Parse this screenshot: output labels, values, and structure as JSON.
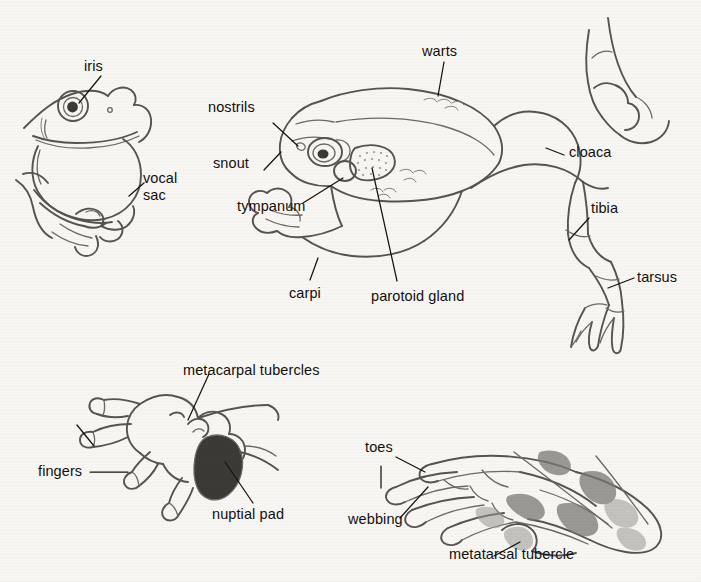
{
  "figure": {
    "background_color": "#f7f6f3",
    "ink_color": "#4a4a4a",
    "label_color": "#14100c",
    "width": 701,
    "height": 582
  },
  "panels": [
    {
      "id": "calling-male-head",
      "name": "Frog head with inflated vocal sac"
    },
    {
      "id": "dorsolateral-body",
      "name": "Whole frog, dorsolateral view"
    },
    {
      "id": "hand",
      "name": "Frog hand (forefoot) with nuptial pad"
    },
    {
      "id": "foot",
      "name": "Frog hind foot with webbing"
    }
  ],
  "labels": [
    {
      "id": "iris",
      "text": "iris",
      "panel": "calling-male-head"
    },
    {
      "id": "vocal-sac",
      "text": "vocal\nsac",
      "panel": "calling-male-head"
    },
    {
      "id": "nostrils",
      "text": "nostrils",
      "panel": "dorsolateral-body"
    },
    {
      "id": "snout",
      "text": "snout",
      "panel": "dorsolateral-body"
    },
    {
      "id": "tympanum",
      "text": "tympanum",
      "panel": "dorsolateral-body"
    },
    {
      "id": "warts",
      "text": "warts",
      "panel": "dorsolateral-body"
    },
    {
      "id": "cloaca",
      "text": "cloaca",
      "panel": "dorsolateral-body"
    },
    {
      "id": "tibia",
      "text": "tibia",
      "panel": "dorsolateral-body"
    },
    {
      "id": "tarsus",
      "text": "tarsus",
      "panel": "dorsolateral-body"
    },
    {
      "id": "carpi",
      "text": "carpi",
      "panel": "dorsolateral-body"
    },
    {
      "id": "parotoid-gland",
      "text": "parotoid gland",
      "panel": "dorsolateral-body"
    },
    {
      "id": "metacarpal-tubercles",
      "text": "metacarpal tubercles",
      "panel": "hand"
    },
    {
      "id": "fingers",
      "text": "fingers",
      "panel": "hand"
    },
    {
      "id": "nuptial-pad",
      "text": "nuptial pad",
      "panel": "hand"
    },
    {
      "id": "toes",
      "text": "toes",
      "panel": "foot"
    },
    {
      "id": "webbing",
      "text": "webbing",
      "panel": "foot"
    },
    {
      "id": "metatarsal-tubercle",
      "text": "metatarsal tubercle",
      "panel": "foot"
    }
  ]
}
